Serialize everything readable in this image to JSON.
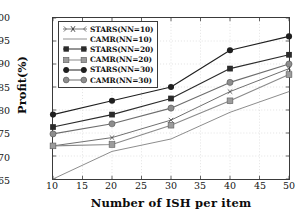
{
  "chart_data": {
    "type": "line",
    "title": "",
    "xlabel": "Number of ISH per item",
    "ylabel": "Profit(%)",
    "x": [
      10,
      20,
      30,
      40,
      50
    ],
    "xlim": [
      10,
      50
    ],
    "ylim": [
      65,
      100
    ],
    "xticks": [
      10,
      15,
      20,
      25,
      30,
      35,
      40,
      45,
      50
    ],
    "yticks": [
      65,
      70,
      75,
      80,
      85,
      90,
      95,
      100
    ],
    "grid": true,
    "legend_position": "upper-left",
    "series": [
      {
        "name": "STARS(NN=10)",
        "marker": "x-marker",
        "color": "#555555",
        "values": [
          72.2,
          74.0,
          77.8,
          84.0,
          89.0
        ]
      },
      {
        "name": "CAMR(NN=10)",
        "marker": "none",
        "color": "#777777",
        "values": [
          65.0,
          71.0,
          73.7,
          79.5,
          84.0
        ]
      },
      {
        "name": "STARS(NN=20)",
        "marker": "filled-square",
        "color": "#2b2b2b",
        "values": [
          76.3,
          79.0,
          82.5,
          89.0,
          92.0
        ]
      },
      {
        "name": "CAMR(NN=20)",
        "marker": "gray-square",
        "color": "#8a8a8a",
        "values": [
          72.2,
          72.5,
          76.7,
          82.0,
          87.7
        ]
      },
      {
        "name": "STARS(NN=30)",
        "marker": "filled-circle",
        "color": "#1f1f1f",
        "values": [
          79.0,
          82.0,
          85.0,
          93.0,
          96.0
        ]
      },
      {
        "name": "CAMR(NN=30)",
        "marker": "gray-circle",
        "color": "#6e6e6e",
        "values": [
          74.8,
          77.0,
          80.4,
          86.0,
          90.0
        ]
      }
    ]
  },
  "axis": {
    "ytick_labels": [
      "100",
      "95",
      "90",
      "85",
      "80",
      "75",
      "70",
      "65"
    ],
    "xtick_labels": [
      "10",
      "15",
      "20",
      "25",
      "30",
      "35",
      "40",
      "45",
      "50"
    ]
  },
  "legend": {
    "items": [
      {
        "label": "STARS(NN=10)"
      },
      {
        "label": "CAMR(NN=10)"
      },
      {
        "label": "STARS(NN=20)"
      },
      {
        "label": "CAMR(NN=20)"
      },
      {
        "label": "STARS(NN=30)"
      },
      {
        "label": "CAMR(NN=30)"
      }
    ]
  },
  "colors": {
    "grid": "#cfcfcf",
    "frame": "#3a3a3a",
    "text": "#111111"
  }
}
